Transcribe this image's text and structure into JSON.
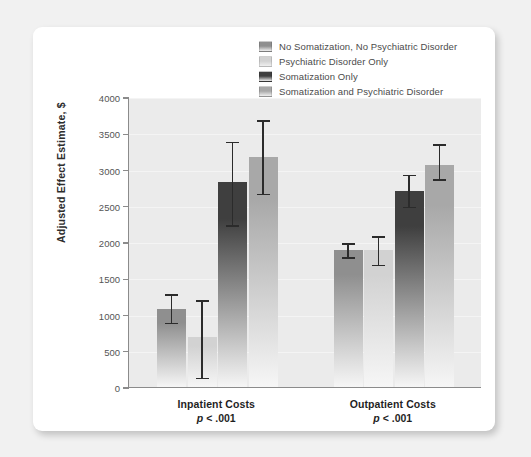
{
  "chart_data": {
    "type": "bar",
    "title": "",
    "subtitle": "",
    "xlabel": "",
    "ylabel": "Adjusted Effect Estimate, $",
    "ylim": [
      0,
      4000
    ],
    "ytick_labels": [
      "0",
      "500",
      "1000",
      "1500",
      "2000",
      "2500",
      "3000",
      "3500",
      "4000"
    ],
    "ytick_values": [
      0,
      500,
      1000,
      1500,
      2000,
      2500,
      3000,
      3500,
      4000
    ],
    "grid": true,
    "legend_position": "top-right",
    "categories": [
      "Inpatient Costs",
      "Outpatient Costs"
    ],
    "category_annotations": [
      "p < .001",
      "p < .001"
    ],
    "series": [
      {
        "name": "No Somatization, No Psychiatric Disorder",
        "color": "#8f8f8f",
        "values": [
          1080,
          1890
        ],
        "err_low": [
          880,
          1780
        ],
        "err_high": [
          1290,
          2000
        ]
      },
      {
        "name": "Psychiatric Disorder Only",
        "color": "#d2d2d2",
        "values": [
          690,
          1890
        ],
        "err_low": [
          120,
          1680
        ],
        "err_high": [
          1210,
          2090
        ]
      },
      {
        "name": "Somatization Only",
        "color": "#3f3f3f",
        "values": [
          2830,
          2710
        ],
        "err_low": [
          2220,
          2480
        ],
        "err_high": [
          3400,
          2940
        ]
      },
      {
        "name": "Somatization and Psychiatric Disorder",
        "color": "#a8a8a8",
        "values": [
          3170,
          3060
        ],
        "err_low": [
          2660,
          2860
        ],
        "err_high": [
          3690,
          3360
        ]
      }
    ]
  },
  "legend": {
    "items": [
      {
        "label": "No Somatization, No Psychiatric Disorder",
        "color": "#8f8f8f"
      },
      {
        "label": "Psychiatric Disorder Only",
        "color": "#d2d2d2"
      },
      {
        "label": "Somatization Only",
        "color": "#3f3f3f"
      },
      {
        "label": "Somatization and Psychiatric Disorder",
        "color": "#a8a8a8"
      }
    ]
  },
  "axis": {
    "y_title": "Adjusted Effect Estimate, $"
  },
  "groups": [
    {
      "label": "Inpatient Costs",
      "pvalue": "p < .001"
    },
    {
      "label": "Outpatient Costs",
      "pvalue": "p < .001"
    }
  ]
}
